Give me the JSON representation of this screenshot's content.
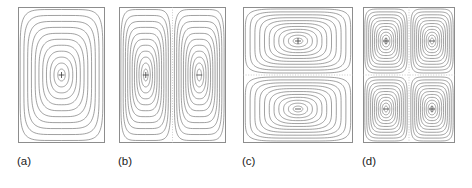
{
  "figure": {
    "background_color": "#ffffff",
    "contour_color": "#6e6e6e",
    "frame_color": "#8d8d8d",
    "divider_color": "#b4b4b4",
    "mark_color": "#3a3a3a",
    "label_color": "#1a1a1a"
  },
  "panels": [
    {
      "id": "a",
      "label": "(a)",
      "x": 18,
      "y": 7,
      "w": 87,
      "h": 136,
      "cells_x": 1,
      "cells_y": 1,
      "dividers_v": [],
      "dividers_h": [],
      "cells": [
        {
          "sign": "+",
          "cx": 0.5,
          "cy": 0.5
        }
      ]
    },
    {
      "id": "b",
      "label": "(b)",
      "x": 119,
      "y": 7,
      "w": 107,
      "h": 136,
      "cells_x": 2,
      "cells_y": 1,
      "dividers_v": [
        0.5
      ],
      "dividers_h": [],
      "cells": [
        {
          "sign": "+",
          "cx": 0.25,
          "cy": 0.5
        },
        {
          "sign": "−",
          "cx": 0.75,
          "cy": 0.5
        }
      ]
    },
    {
      "id": "c",
      "label": "(c)",
      "x": 243,
      "y": 7,
      "w": 110,
      "h": 136,
      "cells_x": 1,
      "cells_y": 2,
      "dividers_v": [],
      "dividers_h": [
        0.5
      ],
      "cells": [
        {
          "sign": "+",
          "cx": 0.5,
          "cy": 0.25
        },
        {
          "sign": "−",
          "cx": 0.5,
          "cy": 0.75
        }
      ]
    },
    {
      "id": "d",
      "label": "(d)",
      "x": 363,
      "y": 7,
      "w": 92,
      "h": 136,
      "cells_x": 2,
      "cells_y": 2,
      "dividers_v": [
        0.5
      ],
      "dividers_h": [
        0.5
      ],
      "cells": [
        {
          "sign": "+",
          "cx": 0.25,
          "cy": 0.25
        },
        {
          "sign": "−",
          "cx": 0.75,
          "cy": 0.25
        },
        {
          "sign": "−",
          "cx": 0.25,
          "cy": 0.75
        },
        {
          "sign": "+",
          "cx": 0.75,
          "cy": 0.75
        }
      ]
    }
  ],
  "labels": [
    {
      "text": "(a)",
      "x": 17,
      "y": 154
    },
    {
      "text": "(b)",
      "x": 118,
      "y": 154
    },
    {
      "text": "(c)",
      "x": 242,
      "y": 154
    },
    {
      "text": "(d)",
      "x": 362,
      "y": 154
    }
  ],
  "chart_data": {
    "type": "contour",
    "title": "",
    "subtitle": "",
    "xlabel": "",
    "ylabel": "",
    "grid": false,
    "legend": "none",
    "n_contour_levels": 11,
    "panels": [
      {
        "id": "a",
        "label": "(a)",
        "cells": 1,
        "layout": "1x1",
        "signs": [
          "+"
        ]
      },
      {
        "id": "b",
        "label": "(b)",
        "cells": 2,
        "layout": "2x1",
        "signs": [
          "+",
          "−"
        ]
      },
      {
        "id": "c",
        "label": "(c)",
        "cells": 2,
        "layout": "1x2",
        "signs": [
          "+",
          "−"
        ]
      },
      {
        "id": "d",
        "label": "(d)",
        "cells": 4,
        "layout": "2x2",
        "signs": [
          "+",
          "−",
          "−",
          "+"
        ]
      }
    ]
  }
}
